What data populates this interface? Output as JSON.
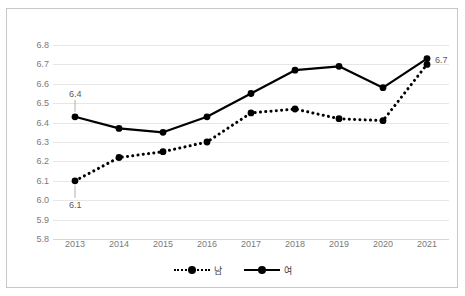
{
  "toolbar": {
    "items": [
      "",
      "",
      "",
      "",
      "",
      "",
      "",
      ""
    ]
  },
  "legend": {
    "entries": [
      {
        "label": "남",
        "style": "dotted"
      },
      {
        "label": "여",
        "style": "solid"
      }
    ]
  },
  "chart_data": {
    "type": "line",
    "title": "",
    "xlabel": "",
    "ylabel": "",
    "grid": true,
    "legend_position": "bottom",
    "ylim": [
      5.8,
      6.8
    ],
    "ytick_step": 0.1,
    "yticks": [
      "6.8",
      "6.7",
      "6.6",
      "6.5",
      "6.4",
      "6.3",
      "6.2",
      "6.1",
      "6.0",
      "5.9",
      "5.8"
    ],
    "categories": [
      "2013",
      "2014",
      "2015",
      "2016",
      "2017",
      "2018",
      "2019",
      "2020",
      "2021"
    ],
    "series": [
      {
        "name": "남",
        "style": "dotted",
        "marker": "circle",
        "values": [
          6.1,
          6.22,
          6.25,
          6.3,
          6.45,
          6.47,
          6.42,
          6.41,
          6.7
        ]
      },
      {
        "name": "여",
        "style": "solid",
        "marker": "circle",
        "values": [
          6.43,
          6.37,
          6.35,
          6.43,
          6.55,
          6.67,
          6.69,
          6.58,
          6.73
        ]
      }
    ],
    "annotations": [
      {
        "text": "6.4",
        "series": "여",
        "category": "2013",
        "value": 6.43,
        "position": "above"
      },
      {
        "text": "6.1",
        "series": "남",
        "category": "2013",
        "value": 6.1,
        "position": "below"
      },
      {
        "text": "6.7",
        "series": "여",
        "category": "2021",
        "value": 6.73,
        "position": "right"
      }
    ]
  }
}
